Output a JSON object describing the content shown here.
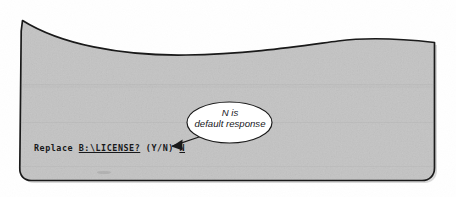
{
  "figure": {
    "kind": "screen-fragment-with-callout",
    "background_color": "#ffffff",
    "screen_fill_color": "#c3c3c3",
    "screen_outline_color": "#1a1a1a",
    "noise": "scanned halftone grain"
  },
  "terminal": {
    "prompt_prefix": "Replace ",
    "prompt_path": "B:\\LICENSE?",
    "prompt_options": " (Y/N) ",
    "prompt_default": "N",
    "full_line": "Replace B:\\LICENSE? (Y/N) N",
    "text_color": "#17181a"
  },
  "callout": {
    "shape": "ellipse",
    "fill_color": "#ffffff",
    "outline_color": "#1a1a1a",
    "line1": "N is",
    "line2": "default response",
    "pointer": "arrow-icon"
  }
}
